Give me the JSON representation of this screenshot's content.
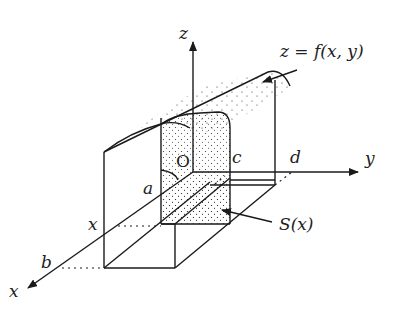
{
  "figure": {
    "labels": {
      "z_axis": "z",
      "y_axis": "y",
      "x_axis": "x",
      "origin": "O",
      "a": "a",
      "b": "b",
      "c": "c",
      "d": "d",
      "x_section": "x",
      "surface": "z = f(x, y)",
      "cross_section": "S(x)"
    },
    "colors": {
      "line": "#1a1a1a",
      "stipple": "#333333",
      "background": "#ffffff"
    }
  }
}
